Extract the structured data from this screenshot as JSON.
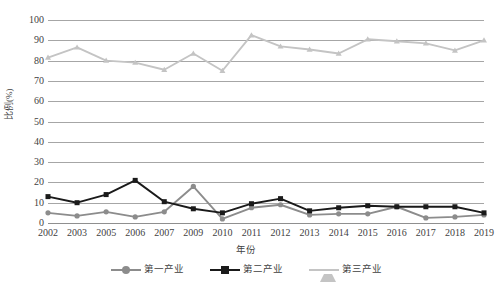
{
  "chart_data": {
    "type": "line",
    "title": "",
    "xlabel": "年份",
    "ylabel": "比例(%)",
    "ylim": [
      0,
      100
    ],
    "ytick_step": 10,
    "yticks": [
      100,
      90,
      80,
      70,
      60,
      50,
      40,
      30,
      20,
      10,
      0
    ],
    "grid": true,
    "legend_position": "bottom",
    "categories": [
      "2002",
      "2003",
      "2005",
      "2006",
      "2007",
      "2009",
      "2010",
      "2011",
      "2012",
      "2013",
      "2014",
      "2015",
      "2016",
      "2017",
      "2018",
      "2019"
    ],
    "series": [
      {
        "name": "第一产业",
        "color": "#8c8c8c",
        "marker": "circle",
        "values": [
          5.0,
          3.5,
          5.5,
          3.0,
          5.5,
          18.0,
          2.0,
          7.5,
          9.0,
          4.0,
          4.5,
          4.5,
          8.0,
          2.5,
          3.0,
          4.0
        ]
      },
      {
        "name": "第二产业",
        "color": "#1a1a1a",
        "marker": "square",
        "values": [
          13.0,
          10.0,
          14.0,
          21.0,
          10.5,
          7.0,
          5.0,
          9.5,
          12.0,
          6.0,
          7.5,
          8.5,
          8.0,
          8.0,
          8.0,
          5.0
        ]
      },
      {
        "name": "第三产业",
        "color": "#c4c4c4",
        "marker": "triangle",
        "values": [
          81.5,
          86.5,
          80.0,
          79.0,
          75.5,
          83.5,
          75.0,
          92.5,
          87.0,
          85.5,
          83.5,
          90.5,
          89.5,
          88.5,
          85.0,
          90.0
        ]
      }
    ]
  },
  "axes": {
    "y_title": "比例(%)",
    "x_title": "年份"
  },
  "colors": {
    "primary_industry": "#8c8c8c",
    "secondary_industry": "#1a1a1a",
    "tertiary_industry": "#c4c4c4",
    "gridline": "#a6a6a6",
    "text": "#3f3f3f",
    "background": "#ffffff"
  }
}
